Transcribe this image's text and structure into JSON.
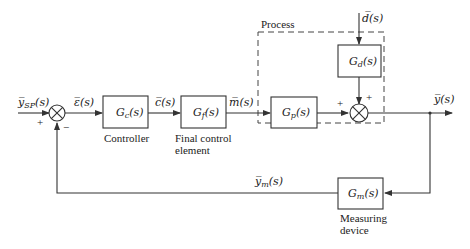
{
  "diagram": {
    "signals": {
      "setpoint": "y̅SP(s)",
      "setpoint_main": "y̅",
      "setpoint_sub": "SP",
      "setpoint_arg": "(s)",
      "error": "ε̅(s)",
      "controller_output": "c̅(s)",
      "manipulated": "m̅(s)",
      "disturbance": "d̅(s)",
      "output": "y̅(s)",
      "measured_main": "y̅",
      "measured_sub": "m",
      "measured_arg": "(s)"
    },
    "blocks": {
      "controller": {
        "main": "G",
        "sub": "c",
        "arg": "(s)",
        "caption": [
          "Controller"
        ]
      },
      "final_control": {
        "main": "G",
        "sub": "f",
        "arg": "(s)",
        "caption": [
          "Final control",
          "element"
        ]
      },
      "process": {
        "main": "G",
        "sub": "p",
        "arg": "(s)"
      },
      "disturbance": {
        "main": "G",
        "sub": "d",
        "arg": "(s)"
      },
      "measuring": {
        "main": "G",
        "sub": "m",
        "arg": "(s)",
        "caption": [
          "Measuring",
          "device"
        ]
      }
    },
    "process_group_label": "Process",
    "signs": {
      "sum1_setpoint": "+",
      "sum1_feedback": "−",
      "sum2_process": "+",
      "sum2_disturbance": "+"
    }
  }
}
